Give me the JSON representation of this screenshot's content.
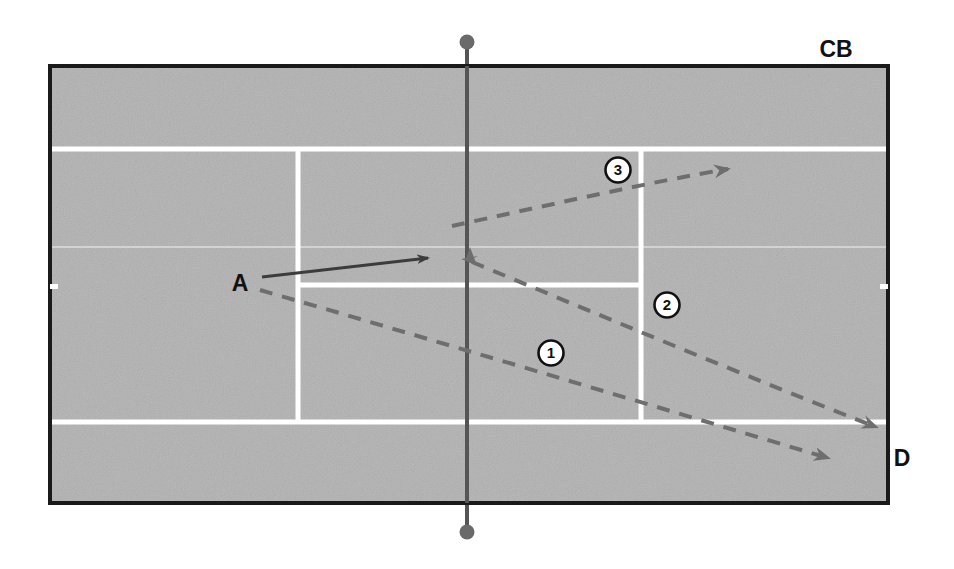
{
  "diagram": {
    "title_labels": {
      "cb": "CB",
      "d": "D",
      "player_a": "A"
    },
    "shot_markers": [
      {
        "id": "marker-1",
        "label": "1",
        "cx": 551,
        "cy": 353
      },
      {
        "id": "marker-2",
        "label": "2",
        "cx": 667,
        "cy": 305
      },
      {
        "id": "marker-3",
        "label": "3",
        "cx": 618,
        "cy": 170
      }
    ],
    "labels": [
      {
        "id": "label-cb",
        "text": "CB",
        "x": 836,
        "y": 57
      },
      {
        "id": "label-d",
        "text": "D",
        "x": 902,
        "y": 466
      },
      {
        "id": "label-a",
        "text": "A",
        "x": 240,
        "y": 291
      }
    ],
    "colors": {
      "court_surface": "#b9b9b9",
      "court_border": "#1a1a1a",
      "court_lines": "#ffffff",
      "net_line": "#555555",
      "solid_arrow": "#3c3c3c",
      "dashed_arrow": "#6e6e6e",
      "label_text": "#111111",
      "page_background": "#ffffff"
    },
    "court": {
      "left": 50,
      "top": 66,
      "right": 888,
      "bottom": 503,
      "doubles_line_top_y": 149,
      "doubles_line_bottom_y": 422,
      "service_line_y": 285,
      "center_faint_line_y": 247,
      "singles_line_left_x": 298,
      "singles_line_right_x": 641,
      "net_x": 467,
      "net_post_top_y": 42,
      "net_post_bottom_y": 532,
      "net_post_radius": 7
    },
    "shots": [
      {
        "id": "shot-approach-a",
        "style": "solid",
        "from": [
          262,
          277
        ],
        "to": [
          432,
          257
        ],
        "description": "A approach"
      },
      {
        "id": "shot-1",
        "style": "dashed",
        "from": [
          260,
          290
        ],
        "to": [
          838,
          461
        ],
        "description": "passing shot 1"
      },
      {
        "id": "shot-2",
        "style": "dashed",
        "from": [
          470,
          261
        ],
        "to": [
          884,
          429
        ],
        "description": "passing shot 2"
      },
      {
        "id": "shot-3",
        "style": "dashed",
        "from": [
          452,
          226
        ],
        "to": [
          742,
          168
        ],
        "description": "passing shot 3"
      },
      {
        "id": "shot-incoming",
        "style": "arrowhead-only",
        "at": [
          465,
          258
        ],
        "description": "incoming ball arrowhead at net"
      }
    ]
  }
}
